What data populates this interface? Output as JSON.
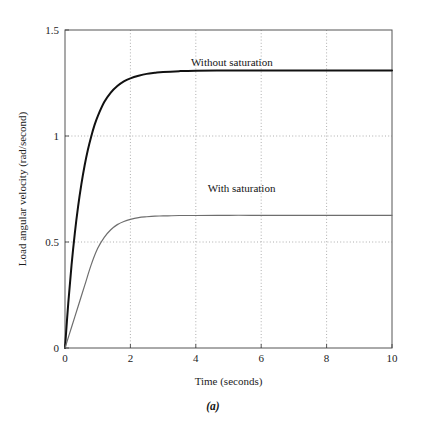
{
  "figure": {
    "caption": "(a)"
  },
  "chart_data": {
    "type": "line",
    "title": "",
    "xlabel": "Time (seconds)",
    "ylabel": "Load angular velocity (rad/second)",
    "xlim": [
      0,
      10
    ],
    "ylim": [
      0,
      1.5
    ],
    "xticks": [
      0,
      2,
      4,
      6,
      8,
      10
    ],
    "xtick_labels": [
      "0",
      "2",
      "4",
      "6",
      "8",
      "10"
    ],
    "yticks": [
      0,
      0.5,
      1,
      1.5
    ],
    "ytick_labels": [
      "0",
      "0.5",
      "1",
      "1.5"
    ],
    "grid": {
      "x": true,
      "y": true,
      "style": "dotted",
      "color": "#9a9a9a"
    },
    "legend": {
      "position": "inline-annotations"
    },
    "series": [
      {
        "name": "Without saturation",
        "color": "#111111",
        "width": 2.0,
        "label_x": 5.1,
        "label_y": 1.33,
        "steady_state": 1.23,
        "time_constant": 0.52,
        "x": [
          0,
          0.1,
          0.2,
          0.3,
          0.4,
          0.5,
          0.6,
          0.7,
          0.8,
          0.9,
          1.0,
          1.2,
          1.4,
          1.6,
          1.8,
          2.0,
          2.25,
          2.5,
          2.75,
          3.0,
          3.5,
          4.0,
          5.0,
          6.0,
          7.0,
          8.0,
          9.0,
          10.0
        ],
        "y": [
          0,
          0.212,
          0.391,
          0.541,
          0.667,
          0.772,
          0.861,
          0.935,
          0.997,
          1.05,
          1.093,
          1.16,
          1.205,
          1.236,
          1.258,
          1.272,
          1.284,
          1.293,
          1.298,
          1.302,
          1.306,
          1.308,
          1.309,
          1.309,
          1.309,
          1.309,
          1.309,
          1.309
        ]
      },
      {
        "name": "With saturation",
        "color": "#6e6e6e",
        "width": 1.2,
        "label_x": 5.4,
        "label_y": 0.735,
        "steady_state": 0.625,
        "ramp_rate": 0.49,
        "x": [
          0,
          0.2,
          0.4,
          0.6,
          0.8,
          1.0,
          1.2,
          1.4,
          1.6,
          1.8,
          2.0,
          2.25,
          2.5,
          2.75,
          3.0,
          3.5,
          4.0,
          5.0,
          6.0,
          7.0,
          8.0,
          9.0,
          10.0
        ],
        "y": [
          0,
          0.098,
          0.196,
          0.294,
          0.392,
          0.47,
          0.522,
          0.558,
          0.582,
          0.597,
          0.607,
          0.615,
          0.619,
          0.622,
          0.623,
          0.625,
          0.625,
          0.626,
          0.626,
          0.626,
          0.626,
          0.626,
          0.626
        ]
      }
    ]
  }
}
